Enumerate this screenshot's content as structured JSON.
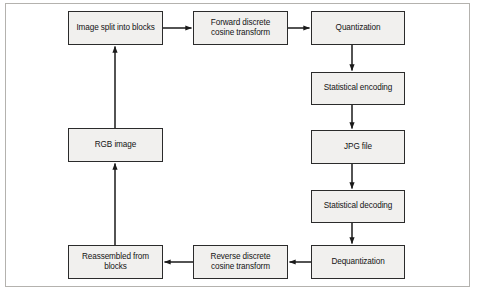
{
  "diagram": {
    "frame": {
      "border_color": "#b4b2ae",
      "background": "#ffffff"
    },
    "style": {
      "node_fill": "#f1f0ee",
      "node_border": "#2b2b2b",
      "edge_color": "#1a1a1a",
      "text_color": "#141414"
    },
    "nodes": [
      {
        "id": "image-split-into-blocks",
        "label": "Image split into blocks",
        "x": 68,
        "y": 11,
        "w": 95,
        "h": 34
      },
      {
        "id": "forward-discrete-cosine-transform",
        "label": "Forward discrete\ncosine transform",
        "x": 193,
        "y": 11,
        "w": 95,
        "h": 34
      },
      {
        "id": "quantization",
        "label": "Quantization",
        "x": 311,
        "y": 11,
        "w": 94,
        "h": 34
      },
      {
        "id": "statistical-encoding",
        "label": "Statistical encoding",
        "x": 311,
        "y": 72,
        "w": 94,
        "h": 33
      },
      {
        "id": "jpg-file",
        "label": "JPG file",
        "x": 311,
        "y": 130,
        "w": 94,
        "h": 34
      },
      {
        "id": "statistical-decoding",
        "label": "Statistical decoding",
        "x": 311,
        "y": 190,
        "w": 94,
        "h": 33
      },
      {
        "id": "dequantization",
        "label": "Dequantization",
        "x": 311,
        "y": 245,
        "w": 94,
        "h": 34
      },
      {
        "id": "reverse-discrete-cosine-transform",
        "label": "Reverse discrete\ncosine transform",
        "x": 193,
        "y": 245,
        "w": 95,
        "h": 34
      },
      {
        "id": "reassembled-from-blocks",
        "label": "Reassembled from\nblocks",
        "x": 68,
        "y": 245,
        "w": 95,
        "h": 34
      },
      {
        "id": "rgb-image",
        "label": "RGB image",
        "x": 68,
        "y": 128,
        "w": 95,
        "h": 34
      }
    ],
    "edges": [
      {
        "id": "edge-split-to-fdct",
        "from": "image-split-into-blocks",
        "to": "forward-discrete-cosine-transform",
        "direction": "right"
      },
      {
        "id": "edge-fdct-to-quantization",
        "from": "forward-discrete-cosine-transform",
        "to": "quantization",
        "direction": "right"
      },
      {
        "id": "edge-quantization-to-encoding",
        "from": "quantization",
        "to": "statistical-encoding",
        "direction": "down"
      },
      {
        "id": "edge-encoding-to-jpg",
        "from": "statistical-encoding",
        "to": "jpg-file",
        "direction": "down"
      },
      {
        "id": "edge-jpg-to-decoding",
        "from": "jpg-file",
        "to": "statistical-decoding",
        "direction": "down"
      },
      {
        "id": "edge-decoding-to-dequantization",
        "from": "statistical-decoding",
        "to": "dequantization",
        "direction": "down"
      },
      {
        "id": "edge-dequantization-to-rdct",
        "from": "dequantization",
        "to": "reverse-discrete-cosine-transform",
        "direction": "left"
      },
      {
        "id": "edge-rdct-to-reassembled",
        "from": "reverse-discrete-cosine-transform",
        "to": "reassembled-from-blocks",
        "direction": "left"
      },
      {
        "id": "edge-reassembled-to-rgb",
        "from": "reassembled-from-blocks",
        "to": "rgb-image",
        "direction": "up"
      },
      {
        "id": "edge-rgb-to-split",
        "from": "rgb-image",
        "to": "image-split-into-blocks",
        "direction": "up"
      }
    ]
  }
}
